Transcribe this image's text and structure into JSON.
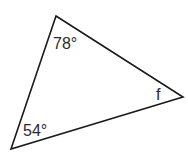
{
  "diagram": {
    "type": "triangle",
    "vertices": {
      "top": [
        56,
        16
      ],
      "right": [
        183,
        97
      ],
      "bottom_left": [
        11,
        149
      ]
    },
    "angles": [
      {
        "vertex": "top",
        "label": "78°"
      },
      {
        "vertex": "bottom_left",
        "label": "54°"
      },
      {
        "vertex": "right",
        "label": "f"
      }
    ],
    "stroke_color": "#1a1a1a"
  }
}
